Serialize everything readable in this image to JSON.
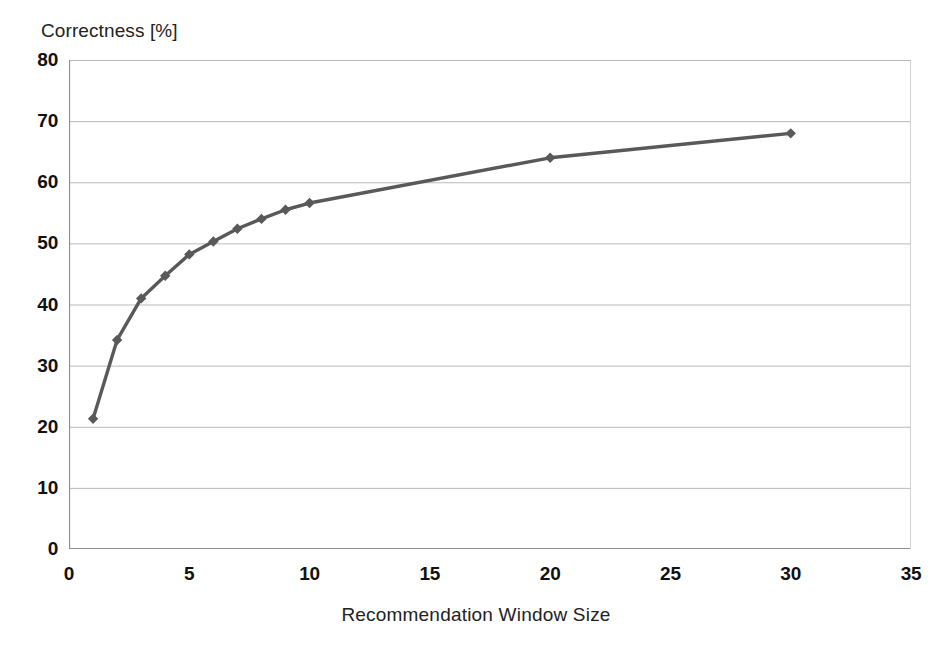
{
  "chart_data": {
    "type": "line",
    "title": "",
    "xlabel": "Recommendation Window Size",
    "ylabel": "Correctness [%]",
    "xlim": [
      0,
      35
    ],
    "ylim": [
      0,
      80
    ],
    "xticks": [
      0,
      5,
      10,
      15,
      20,
      25,
      30,
      35
    ],
    "yticks": [
      0,
      10,
      20,
      30,
      40,
      50,
      60,
      70,
      80
    ],
    "grid": "horizontal",
    "legend": "none",
    "series": [
      {
        "name": "Correctness",
        "marker": "diamond",
        "color": "#595959",
        "x": [
          1,
          2,
          3,
          4,
          5,
          6,
          7,
          8,
          9,
          10,
          20,
          30
        ],
        "y": [
          21.3,
          34.2,
          41.0,
          44.7,
          48.2,
          50.3,
          52.4,
          54.0,
          55.5,
          56.6,
          64.0,
          68.0
        ]
      }
    ]
  },
  "axes": {
    "y_title": "Correctness [%]",
    "x_title": "Recommendation Window Size",
    "y_tick_labels": [
      "80",
      "70",
      "60",
      "50",
      "40",
      "30",
      "20",
      "10",
      "0"
    ],
    "x_tick_labels": [
      "0",
      "5",
      "10",
      "15",
      "20",
      "25",
      "30",
      "35"
    ]
  },
  "style": {
    "line_color": "#595959",
    "grid_color": "#b9b9b9",
    "axis_color": "#8c8c8c",
    "background": "#ffffff"
  }
}
